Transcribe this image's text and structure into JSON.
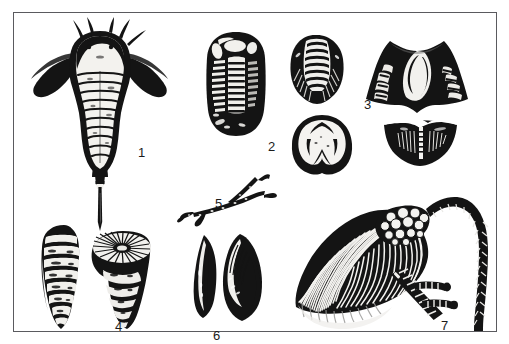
{
  "plate": {
    "kind": "fossil-illustration-plate",
    "background_color": "#ffffff",
    "ink_color": "#141414",
    "frame_color": "#5a5a5e",
    "frame": {
      "x": 13,
      "y": 12,
      "width": 484,
      "height": 320,
      "border_px": 1.5
    }
  },
  "labels": {
    "one": "1",
    "two": "2",
    "three": "3",
    "four": "4",
    "five": "5",
    "six": "6",
    "seven": "7"
  },
  "specimens": [
    {
      "number": "1",
      "name": "eurypterid",
      "description": "Dorsal view of a sea scorpion with broad carapace, segmented abdomen, paired swimming appendages and long pointed telson",
      "views": 1,
      "position": {
        "x": 22,
        "y": 16,
        "width": 140,
        "height": 170
      }
    },
    {
      "number": "2",
      "name": "trilobite",
      "description": "Dorsal view of a trilobite showing cephalon, axial lobe, segmented thorax and pygidium",
      "views": 1,
      "position": {
        "x": 196,
        "y": 26,
        "width": 62,
        "height": 105
      }
    },
    {
      "number": "3",
      "name": "brachiopods",
      "description": "Four views of brachiopod shells: ribbed pedicle valve, spiriferid wide-hinged shell, rounded anterior view and concave commissure view",
      "views": 4,
      "position": {
        "x": 282,
        "y": 22,
        "width": 190,
        "height": 140
      }
    },
    {
      "number": "4",
      "name": "rugose-corals",
      "description": "Two horn corals, a side view of the conical corallite and an oblique view showing the calice with radiating septa",
      "views": 2,
      "position": {
        "x": 26,
        "y": 214,
        "width": 130,
        "height": 112
      }
    },
    {
      "number": "5",
      "name": "branching-bryozoan",
      "description": "Slender forked twig-like branching colony fragment",
      "views": 1,
      "position": {
        "x": 172,
        "y": 172,
        "width": 96,
        "height": 42
      }
    },
    {
      "number": "6",
      "name": "bivalve-mollusks",
      "description": "Two elongate bivalve shells in side and exterior view",
      "views": 2,
      "position": {
        "x": 180,
        "y": 226,
        "width": 78,
        "height": 90
      }
    },
    {
      "number": "7",
      "name": "crinoid-and-stems",
      "description": "Crinoid crown with plated calyx and long filamentous arms, beside two segmented columnal stems, one curving",
      "views": 3,
      "position": {
        "x": 262,
        "y": 170,
        "width": 222,
        "height": 155
      }
    }
  ]
}
